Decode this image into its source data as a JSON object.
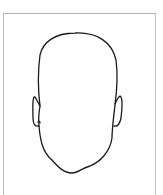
{
  "figure": {
    "stroke_color": "#1a1a1a",
    "frame_color": "#b8b8b8",
    "background": "#ffffff"
  }
}
